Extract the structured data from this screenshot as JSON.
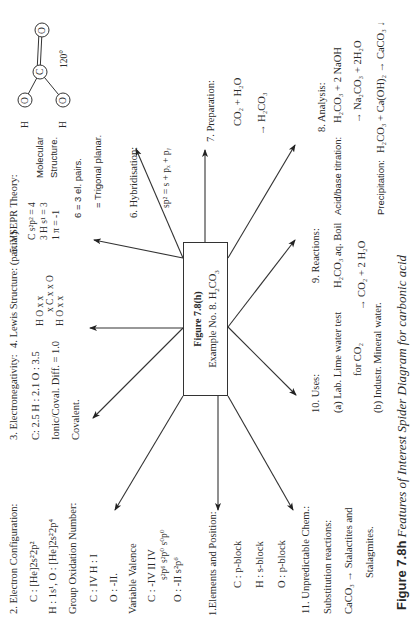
{
  "center": {
    "title": "Figure 7.8(h)",
    "subtitle_prefix": "Example No.  8.  ",
    "compound": "H2CO3"
  },
  "caption": {
    "label": "Figure 7.8h",
    "text": "Features of Interest Spider Diagram for carbonic acid"
  },
  "sections": {
    "s1": {
      "heading": "1.Elements and  Position:",
      "lines": [
        "C : p-block",
        "H : s-block",
        "O : p-block"
      ]
    },
    "s2": {
      "heading": "2.  Electron  Configuration:",
      "line1": "C : [He]2s²2p²",
      "line2": "H : 1s¹,  O : [He]2s²2p⁴",
      "line3": "Group Oxidation Number:",
      "line4": "C : IV     H : I",
      "line5": "O : -II.",
      "line6": "Variable  Valence",
      "valence_c": "C :  -IV    II    IV",
      "valence_c_config": "s²p⁶   s²p⁰   s⁰p⁰",
      "valence_o": "O : -II    s²p⁶"
    },
    "s3": {
      "heading": "3.  Electronegativity:",
      "line1": "C: 2.5  H : 2.1     O : 3.5",
      "line2": "Ionic/Coval.  Diff. = 1.0",
      "line3": "Covalent."
    },
    "s4": {
      "heading": "4.  Lewis  Structure:     (partial)",
      "row1": "H O  x    x",
      "row1b": "x   C  x x  O",
      "row2": "H O  x    x"
    },
    "s5": {
      "heading": "5.  VSEPR  Theory:",
      "line1": "C  s²p²   = 4",
      "line2": "3 H s¹    = 3",
      "line3": "1 π        = -1",
      "line4": "6 = 3 el. pairs.",
      "line5": "= Trigonal planar.",
      "structure_label1": "Molecular",
      "structure_label2": "Structure.",
      "angle": "120°",
      "atoms": [
        "O",
        "C",
        "O",
        "O",
        "H",
        "H"
      ]
    },
    "s6": {
      "heading": "6.  Hybridisation:",
      "line1": "sp² = s + pₓ + pᵧ"
    },
    "s7": {
      "heading": "7.   Preparation:",
      "line1": "CO₂  +  H₂O",
      "line2": "→  H₂CO₃"
    },
    "s8": {
      "heading": "8.   Analysis:",
      "titration_label": "Acid/base titration:",
      "titration_eq1": "H₂CO₃    + 2 NaOH",
      "titration_eq2": "→  Na₂CO₃   + 2H₂O",
      "precip_label": "Precipitation:",
      "precip_eq": "H₂CO₃  + Ca(OH)₂   →  CaCO₃ ↓"
    },
    "s9": {
      "heading": "9.      Reactions:",
      "line1": "H₂CO₃   aq.  Boil",
      "line2": "→  CO₂  + 2 H₂O"
    },
    "s10": {
      "heading": "10.   Uses:",
      "line1": "(a) Lab.  Lime water test",
      "line2": "for CO₂",
      "line3": "(b) Industr.   Mineral water."
    },
    "s11": {
      "heading": "11.     Unpredictable  Chem.:",
      "line1": "Substitution  reactions:",
      "line2": "CaCO₃  →  Stalactites and",
      "line3": "Stalagmites."
    }
  },
  "colors": {
    "ink": "#2a2a2a",
    "background": "#ffffff"
  }
}
